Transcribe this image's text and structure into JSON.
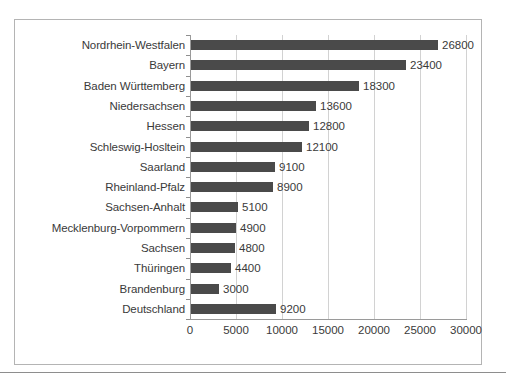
{
  "top_caption": "",
  "chart_data": {
    "type": "bar",
    "orientation": "horizontal",
    "title": "",
    "xlabel": "",
    "ylabel": "",
    "xlim": [
      0,
      30000
    ],
    "xticks": [
      "0",
      "5000",
      "10000",
      "15000",
      "20000",
      "25000",
      "30000"
    ],
    "xtick_values": [
      0,
      5000,
      10000,
      15000,
      20000,
      25000,
      30000
    ],
    "grid": true,
    "legend": false,
    "bar_color": "#4a4a4a",
    "gridline_color": "#d2d2d2",
    "axis_color": "#9a9a9a",
    "frame_color": "#b4b4b4",
    "categories": [
      "Nordrhein-Westfalen",
      "Bayern",
      "Baden Württemberg",
      "Niedersachsen",
      "Hessen",
      "Schleswig-Hosltein",
      "Saarland",
      "Rheinland-Pfalz",
      "Sachsen-Anhalt",
      "Mecklenburg-Vorpommern",
      "Sachsen",
      "Thüringen",
      "Brandenburg",
      "Deutschland"
    ],
    "values": [
      26800,
      23400,
      18300,
      13600,
      12800,
      12100,
      9100,
      8900,
      5100,
      4900,
      4800,
      4400,
      3000,
      9200
    ],
    "value_labels": [
      "26800",
      "23400",
      "18300",
      "13600",
      "12800",
      "12100",
      "9100",
      "8900",
      "5100",
      "4900",
      "4800",
      "4400",
      "3000",
      "9200"
    ]
  }
}
